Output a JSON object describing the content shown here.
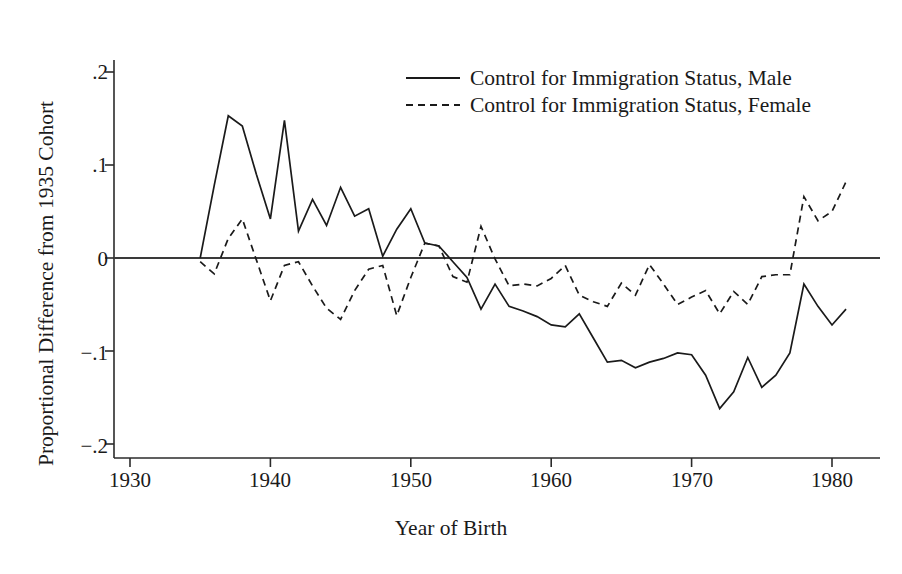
{
  "chart_data": {
    "type": "line",
    "title": "",
    "xlabel": "Year of Birth",
    "ylabel": "Proportional Difference from 1935 Cohort",
    "xlim": [
      1927.5,
      1983.5
    ],
    "ylim": [
      -0.23,
      0.225
    ],
    "xticks": [
      1930,
      1940,
      1950,
      1960,
      1970,
      1980
    ],
    "xtick_labels": [
      "1930",
      "1940",
      "1950",
      "1960",
      "1970",
      "1980"
    ],
    "yticks": [
      0.2,
      0.1,
      0,
      -0.1,
      -0.2
    ],
    "ytick_labels": [
      ".2",
      ".1",
      "0",
      "−.1",
      "−.2"
    ],
    "grid": false,
    "zero_reference_line": 0,
    "legend_position": "top-center-right",
    "x": [
      1935,
      1936,
      1937,
      1938,
      1939,
      1940,
      1941,
      1942,
      1943,
      1944,
      1945,
      1946,
      1947,
      1948,
      1949,
      1950,
      1951,
      1952,
      1953,
      1954,
      1955,
      1956,
      1957,
      1958,
      1959,
      1960,
      1961,
      1962,
      1963,
      1964,
      1965,
      1966,
      1967,
      1968,
      1969,
      1970,
      1971,
      1972,
      1973,
      1974,
      1975,
      1976,
      1977,
      1978,
      1979,
      1980,
      1981
    ],
    "series": [
      {
        "name": "Control for Immigration Status, Male",
        "style": "solid",
        "values": [
          0.0,
          0.078,
          0.153,
          0.142,
          0.09,
          0.042,
          0.148,
          0.029,
          0.063,
          0.035,
          0.076,
          0.045,
          0.053,
          0.002,
          0.031,
          0.053,
          0.016,
          0.013,
          -0.004,
          -0.021,
          -0.055,
          -0.028,
          -0.052,
          -0.057,
          -0.063,
          -0.072,
          -0.074,
          -0.06,
          -0.086,
          -0.112,
          -0.11,
          -0.118,
          -0.112,
          -0.108,
          -0.102,
          -0.104,
          -0.126,
          -0.162,
          -0.144,
          -0.107,
          -0.139,
          -0.126,
          -0.102,
          -0.028,
          -0.052,
          -0.072,
          -0.055
        ]
      },
      {
        "name": "Control for Immigration Status, Female",
        "style": "dashed",
        "values": [
          -0.004,
          -0.017,
          0.021,
          0.042,
          -0.002,
          -0.046,
          -0.008,
          -0.004,
          -0.03,
          -0.054,
          -0.066,
          -0.035,
          -0.012,
          -0.008,
          -0.062,
          -0.021,
          0.016,
          0.013,
          -0.02,
          -0.026,
          0.034,
          -0.001,
          -0.03,
          -0.028,
          -0.03,
          -0.022,
          -0.008,
          -0.04,
          -0.047,
          -0.052,
          -0.027,
          -0.04,
          -0.007,
          -0.028,
          -0.05,
          -0.042,
          -0.035,
          -0.06,
          -0.036,
          -0.05,
          -0.02,
          -0.018,
          -0.018,
          0.066,
          0.04,
          0.05,
          0.082
        ]
      }
    ]
  },
  "legend": {
    "entries": [
      {
        "label": "Control for Immigration Status, Male",
        "style": "solid"
      },
      {
        "label": "Control for Immigration Status, Female",
        "style": "dashed"
      }
    ]
  },
  "axes": {
    "x_title": "Year of Birth",
    "y_title": "Proportional Difference from 1935 Cohort",
    "x_labels": [
      "1930",
      "1940",
      "1950",
      "1960",
      "1970",
      "1980"
    ],
    "y_labels": [
      ".2",
      ".1",
      "0",
      "−.1",
      "−.2"
    ]
  },
  "colors": {
    "ink": "#1a1a1a",
    "background": "#ffffff"
  }
}
